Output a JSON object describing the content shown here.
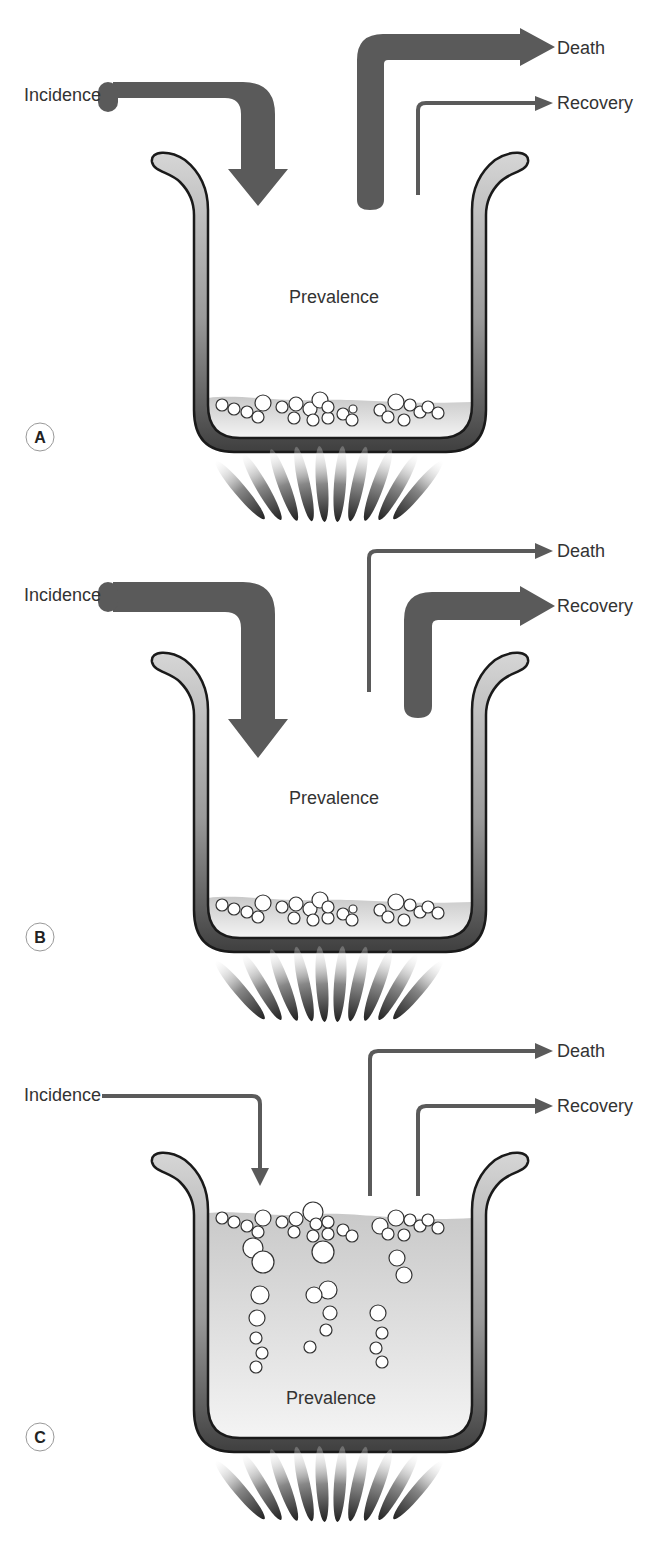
{
  "figure": {
    "colors": {
      "arrow": "#5a5a5a",
      "pot_outline": "#1a1a1a",
      "pot_wall_light": "#cfcfcf",
      "pot_wall_dark": "#444444",
      "liquid": "#d8d8d8",
      "text": "#333333"
    },
    "panels": [
      {
        "letter": "A",
        "incidence_label": "Incidence",
        "death_label": "Death",
        "recovery_label": "Recovery",
        "prevalence_label": "Prevalence",
        "incidence_flow": "large",
        "death_flow": "large",
        "recovery_flow": "small",
        "prevalence_level": "low"
      },
      {
        "letter": "B",
        "incidence_label": "Incidence",
        "death_label": "Death",
        "recovery_label": "Recovery",
        "prevalence_label": "Prevalence",
        "incidence_flow": "large",
        "death_flow": "small",
        "recovery_flow": "large",
        "prevalence_level": "low"
      },
      {
        "letter": "C",
        "incidence_label": "Incidence",
        "death_label": "Death",
        "recovery_label": "Recovery",
        "prevalence_label": "Prevalence",
        "incidence_flow": "small",
        "death_flow": "small",
        "recovery_flow": "small",
        "prevalence_level": "high"
      }
    ]
  }
}
